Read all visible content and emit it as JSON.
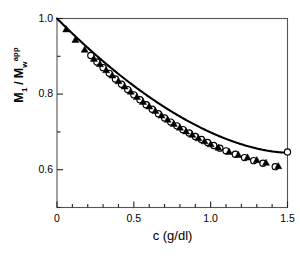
{
  "chart_data": {
    "type": "line",
    "title": "",
    "xlabel": "c  (g/dl)",
    "ylabel": "M1 / Mw app",
    "ylabel_parts": {
      "num": "M",
      "num_sub": "1",
      "den": "M",
      "den_sub": "w",
      "den_sup": "app"
    },
    "xlim": [
      0,
      1.5
    ],
    "ylim": [
      0.5,
      1.0
    ],
    "xticks": [
      0,
      0.5,
      1.0,
      1.5
    ],
    "xticklabels": [
      "0",
      "0.5",
      "1.0",
      "1.5"
    ],
    "xminor_step": 0.1,
    "yticks": [
      0.6,
      0.8,
      1.0
    ],
    "yticklabels": [
      "0.6",
      "0.8",
      "1.0"
    ],
    "yminor": [
      0.5,
      0.7,
      0.9
    ],
    "grid": false,
    "legend": "none",
    "frame": "box",
    "series": [
      {
        "name": "fitted curve",
        "kind": "line",
        "marker": "none",
        "color": "#000000",
        "x": [
          0.0,
          0.05,
          0.1,
          0.15,
          0.2,
          0.25,
          0.3,
          0.35,
          0.4,
          0.45,
          0.5,
          0.55,
          0.6,
          0.65,
          0.7,
          0.75,
          0.8,
          0.85,
          0.9,
          0.95,
          1.0,
          1.05,
          1.1,
          1.15,
          1.2,
          1.25,
          1.3,
          1.35,
          1.4,
          1.45,
          1.5
        ],
        "y": [
          1.0,
          0.977,
          0.954,
          0.932,
          0.911,
          0.89,
          0.87,
          0.851,
          0.832,
          0.814,
          0.797,
          0.781,
          0.765,
          0.75,
          0.736,
          0.723,
          0.71,
          0.698,
          0.487,
          0.676,
          0.666,
          0.657,
          0.648,
          0.64,
          0.632,
          0.625,
          0.618,
          0.612,
          0.606,
          0.601,
          0.645
        ]
      },
      {
        "name": "open circles",
        "kind": "scatter",
        "marker": "circle-open",
        "color": "#000000",
        "x": [
          0.22,
          0.26,
          0.3,
          0.34,
          0.38,
          0.42,
          0.46,
          0.5,
          0.54,
          0.58,
          0.62,
          0.66,
          0.7,
          0.74,
          0.78,
          0.82,
          0.86,
          0.9,
          0.94,
          0.98,
          1.02,
          1.06,
          1.1,
          1.16,
          1.22,
          1.28,
          1.34,
          1.42,
          1.5
        ],
        "y": [
          0.902,
          0.885,
          0.87,
          0.855,
          0.84,
          0.826,
          0.812,
          0.798,
          0.785,
          0.772,
          0.76,
          0.748,
          0.737,
          0.726,
          0.716,
          0.706,
          0.697,
          0.688,
          0.68,
          0.672,
          0.664,
          0.657,
          0.65,
          0.641,
          0.632,
          0.624,
          0.617,
          0.608,
          0.647
        ]
      },
      {
        "name": "filled triangles",
        "kind": "scatter",
        "marker": "triangle-filled",
        "color": "#000000",
        "x": [
          0.06,
          0.12,
          0.18,
          0.24,
          0.28,
          0.32,
          0.36,
          0.4,
          0.44,
          0.48,
          0.52,
          0.56,
          0.6,
          0.64,
          0.68,
          0.72,
          0.76,
          0.8,
          0.84,
          0.88,
          0.92,
          0.96,
          1.0,
          1.05,
          1.12,
          1.18,
          1.24,
          1.3,
          1.36,
          1.44
        ],
        "y": [
          0.972,
          0.944,
          0.918,
          0.894,
          0.88,
          0.864,
          0.85,
          0.835,
          0.821,
          0.807,
          0.793,
          0.78,
          0.768,
          0.756,
          0.744,
          0.733,
          0.722,
          0.712,
          0.702,
          0.693,
          0.684,
          0.676,
          0.668,
          0.659,
          0.648,
          0.64,
          0.633,
          0.626,
          0.619,
          0.61
        ]
      }
    ]
  }
}
